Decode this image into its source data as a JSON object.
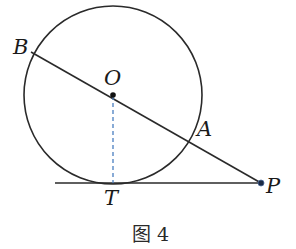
{
  "figure": {
    "caption": "图 4",
    "colors": {
      "stroke": "#2a2a2a",
      "radius_dashed": "#4a7fc0",
      "point_fill": "#1c2a44"
    },
    "circle": {
      "center_label": "O",
      "cx": 113,
      "cy": 95,
      "r": 89
    },
    "points": [
      {
        "name": "B",
        "label": "B",
        "x": 31,
        "y": 52
      },
      {
        "name": "O",
        "label": "O",
        "x": 113,
        "y": 95
      },
      {
        "name": "A",
        "label": "A",
        "x": 190,
        "y": 139
      },
      {
        "name": "P",
        "label": "P",
        "x": 261,
        "y": 183
      },
      {
        "name": "T",
        "label": "T",
        "x": 113,
        "y": 183
      }
    ],
    "segments": [
      {
        "name": "secant-BP",
        "from": "B",
        "to": "P",
        "style": "solid"
      },
      {
        "name": "tangent-line",
        "from_x": 55,
        "to": "P",
        "style": "solid"
      },
      {
        "name": "radius-OT",
        "from": "O",
        "to": "T",
        "style": "dashed"
      }
    ]
  }
}
